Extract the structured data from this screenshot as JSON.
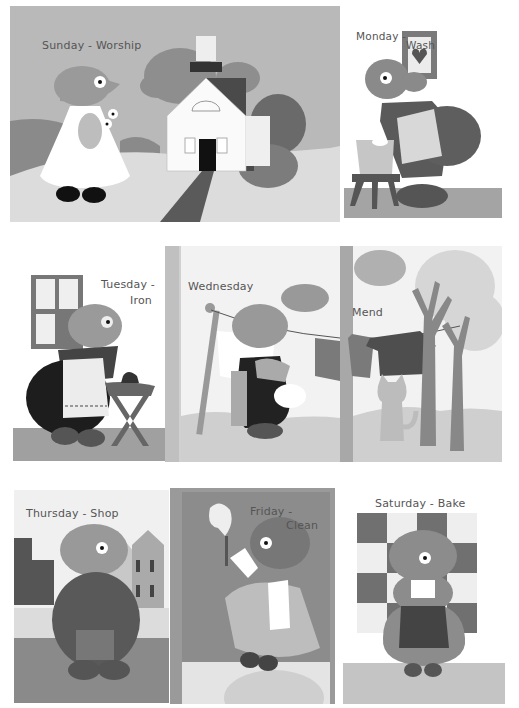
{
  "page": {
    "background": "#ffffff"
  },
  "panels": [
    {
      "id": "sunday",
      "label": "Sunday - Worship",
      "bg": "#b9b9b9"
    },
    {
      "id": "monday",
      "label_part1": "Monday -",
      "label_part2": "Wash",
      "bg": "#ffffff"
    },
    {
      "id": "tuesday",
      "label_part1": "Tuesday -",
      "label_part2": "Iron",
      "bg": "#ffffff"
    },
    {
      "id": "wednesday",
      "label": "Wednesday",
      "bg": "#f2f2f2"
    },
    {
      "id": "mend",
      "label": "Mend",
      "bg": "#f2f2f2"
    },
    {
      "id": "thursday",
      "label": "Thursday - Shop",
      "bg": "#f0f0f0"
    },
    {
      "id": "friday",
      "label_part1": "Friday -",
      "label_part2": "Clean",
      "bg": "#8c8c8c"
    },
    {
      "id": "saturday",
      "label": "Saturday - Bake",
      "bg": "#ffffff"
    }
  ],
  "colors": {
    "light": "#d9d9d9",
    "mid": "#9a9a9a",
    "midDark": "#7a7a7a",
    "dark": "#5a5a5a",
    "darker": "#3c3c3c",
    "black": "#111111",
    "white": "#ffffff"
  }
}
